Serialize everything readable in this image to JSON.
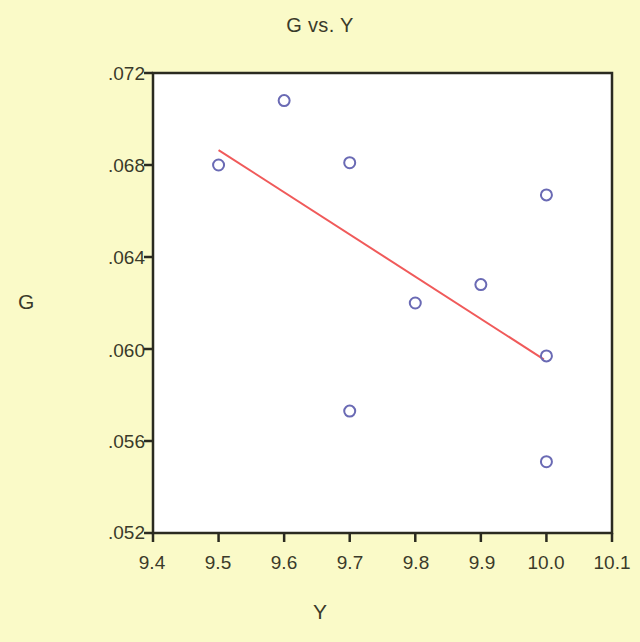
{
  "chart_data": {
    "type": "scatter",
    "title": "G vs. Y",
    "xlabel": "Y",
    "ylabel": "G",
    "xlim": [
      9.4,
      10.1
    ],
    "ylim": [
      0.052,
      0.072
    ],
    "grid": false,
    "legend": null,
    "xticks": [
      9.4,
      9.5,
      9.6,
      9.7,
      9.8,
      9.9,
      10.0,
      10.1
    ],
    "xtick_labels": [
      "9.4",
      "9.5",
      "9.6",
      "9.7",
      "9.8",
      "9.9",
      "10.0",
      "10.1"
    ],
    "yticks": [
      0.072,
      0.068,
      0.064,
      0.06,
      0.056,
      0.052
    ],
    "ytick_labels": [
      ".072",
      ".068",
      ".064",
      ".060",
      ".056",
      ".052"
    ],
    "series": [
      {
        "name": "G",
        "type": "scatter",
        "marker": "open-circle",
        "color": "#6a6ab4",
        "points": [
          {
            "x": 9.5,
            "y": 0.068
          },
          {
            "x": 9.6,
            "y": 0.0708
          },
          {
            "x": 9.7,
            "y": 0.0681
          },
          {
            "x": 9.7,
            "y": 0.0573
          },
          {
            "x": 9.8,
            "y": 0.062
          },
          {
            "x": 9.9,
            "y": 0.0628
          },
          {
            "x": 10.0,
            "y": 0.0667
          },
          {
            "x": 10.0,
            "y": 0.0597
          },
          {
            "x": 10.0,
            "y": 0.0551
          }
        ]
      },
      {
        "name": "fit-line",
        "type": "line",
        "color": "#f05a5a",
        "points": [
          {
            "x": 9.5,
            "y": 0.06865
          },
          {
            "x": 9.996,
            "y": 0.05955
          }
        ]
      }
    ]
  },
  "figure": {
    "background_color": "#fafac8",
    "plot_background_color": "#ffffff",
    "axis_color": "#2a2a20",
    "title": "G vs. Y",
    "xlabel": "Y",
    "ylabel": "G"
  }
}
